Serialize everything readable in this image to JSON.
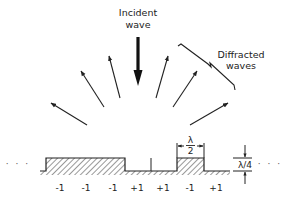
{
  "diagram": {
    "title_lines": [
      "Incident",
      "wave"
    ],
    "diffracted_label_lines": [
      "Diffracted",
      "waves"
    ],
    "ellipsis_left": "· · ·",
    "ellipsis_right": "· · ·",
    "half_wavelength_label": {
      "numerator": "λ",
      "denominator": "2"
    },
    "quarter_wavelength_label": "λ/4",
    "phase_labels": [
      {
        "text": "-1",
        "x": 60
      },
      {
        "text": "-1",
        "x": 86
      },
      {
        "text": "-1",
        "x": 113
      },
      {
        "text": "+1",
        "x": 137
      },
      {
        "text": "+1",
        "x": 163
      },
      {
        "text": "-1",
        "x": 190
      },
      {
        "text": "+1",
        "x": 216
      }
    ],
    "colors": {
      "ink": "#222222",
      "background": "#ffffff"
    }
  }
}
